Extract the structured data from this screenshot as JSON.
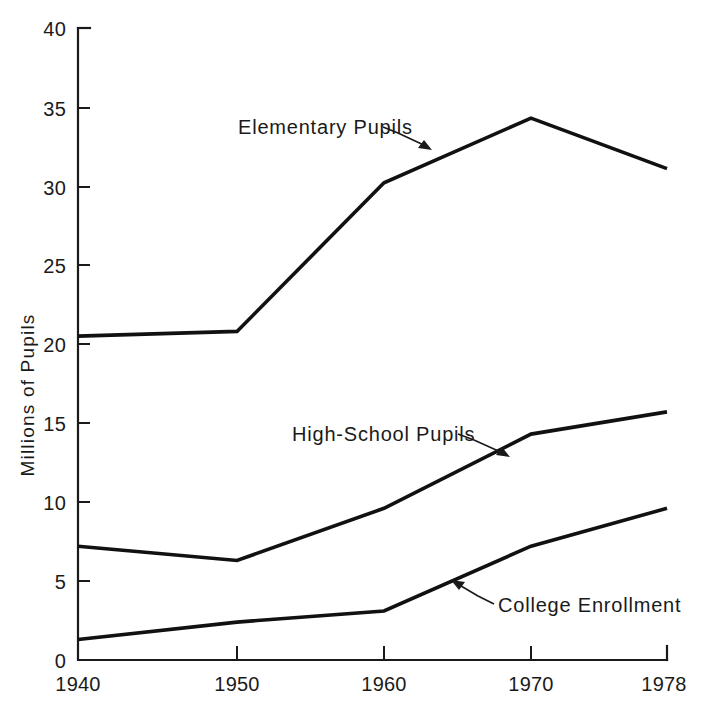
{
  "chart_data": {
    "type": "line",
    "title": "",
    "xlabel": "",
    "ylabel": "Millions of Pupils",
    "x": [
      1940,
      1950,
      1960,
      1970,
      1978
    ],
    "xticklabels": [
      "1940",
      "1950",
      "1960",
      "1970",
      "1978"
    ],
    "yticks": [
      0,
      5,
      10,
      15,
      20,
      25,
      30,
      35,
      40
    ],
    "yticklabels": [
      "0",
      "5",
      "10",
      "15",
      "20",
      "25",
      "30",
      "35",
      "40"
    ],
    "xlim": [
      1940,
      1978
    ],
    "ylim": [
      0,
      40
    ],
    "grid": false,
    "legend_position": "inline-annotations",
    "series": [
      {
        "name": "Elementary Pupils",
        "values": [
          20.5,
          20.8,
          30.2,
          34.3,
          31.1
        ]
      },
      {
        "name": "High-School Pupils",
        "values": [
          7.2,
          6.3,
          9.6,
          14.3,
          15.7
        ]
      },
      {
        "name": "College Enrollment",
        "values": [
          1.3,
          2.4,
          3.1,
          7.2,
          9.6
        ]
      }
    ],
    "annotations": [
      {
        "text": "Elementary Pupils",
        "text_x": 238,
        "text_y": 134,
        "leader_from_x": 380,
        "leader_from_y": 129,
        "leader_to_x": 430,
        "leader_to_y": 150
      },
      {
        "text": "High-School Pupils",
        "text_x": 292,
        "text_y": 441,
        "leader_from_x": 457,
        "leader_from_y": 437,
        "leader_to_x": 508,
        "leader_to_y": 456
      },
      {
        "text": "College Enrollment",
        "text_x": 494,
        "text_y": 606,
        "leader_from_x": 490,
        "leader_from_y": 601,
        "leader_to_x": 452,
        "leader_to_y": 580
      }
    ]
  },
  "axes": {
    "y_tick_labels": [
      "40",
      "35",
      "30",
      "25",
      "20",
      "15",
      "10",
      "5",
      "0"
    ],
    "x_tick_labels": [
      "1940",
      "1950",
      "1960",
      "1970",
      "1978"
    ],
    "y_axis_title": "Millions of Pupils"
  },
  "series_labels": {
    "elementary": "Elementary Pupils",
    "highschool": "High-School Pupils",
    "college": "College Enrollment"
  },
  "colors": {
    "ink": "#111111",
    "background": "#ffffff"
  }
}
